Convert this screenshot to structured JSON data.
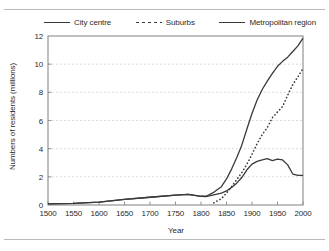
{
  "figure": {
    "has_top_rule": true,
    "has_bottom_rule": true,
    "background": "#ffffff",
    "line_color": "#3a3a3a",
    "grid_color": "#c8c8c8",
    "frame_color": "#8a8a8a"
  },
  "legend": {
    "position": "top",
    "items": [
      {
        "label": "City centre",
        "style": "solid",
        "icon": "solid-line-icon"
      },
      {
        "label": "Suburbs",
        "style": "dashed",
        "icon": "dashed-line-icon"
      },
      {
        "label": "Metropolitan region",
        "style": "solid",
        "icon": "solid-line-icon"
      }
    ]
  },
  "chart_data": {
    "type": "line",
    "title": "",
    "xlabel": "Year",
    "ylabel": "Numbers of residents (millions)",
    "xlim": [
      1500,
      2000
    ],
    "ylim": [
      0,
      12
    ],
    "xticks": [
      1500,
      1550,
      1600,
      1650,
      1700,
      1750,
      1800,
      1850,
      1900,
      1950,
      2000
    ],
    "yticks": [
      0,
      2,
      4,
      6,
      8,
      10,
      12
    ],
    "grid": "horizontal-dotted",
    "legend_position": "top",
    "series": [
      {
        "name": "City centre",
        "style": "solid",
        "x": [
          1500,
          1550,
          1600,
          1650,
          1700,
          1750,
          1775,
          1800,
          1810,
          1825,
          1840,
          1850,
          1860,
          1870,
          1880,
          1890,
          1900,
          1910,
          1920,
          1930,
          1940,
          1950,
          1960,
          1970,
          1980,
          1990,
          2000
        ],
        "values": [
          0.08,
          0.12,
          0.2,
          0.4,
          0.55,
          0.7,
          0.75,
          0.62,
          0.6,
          0.72,
          0.85,
          1.0,
          1.25,
          1.55,
          1.95,
          2.5,
          2.9,
          3.1,
          3.2,
          3.3,
          3.15,
          3.25,
          3.2,
          2.85,
          2.2,
          2.1,
          2.1
        ]
      },
      {
        "name": "Suburbs",
        "style": "dashed",
        "x": [
          1825,
          1840,
          1850,
          1860,
          1870,
          1880,
          1890,
          1900,
          1910,
          1920,
          1930,
          1940,
          1950,
          1960,
          1970,
          1980,
          1990,
          2000
        ],
        "values": [
          0.15,
          0.45,
          0.85,
          1.3,
          1.8,
          2.3,
          2.9,
          3.6,
          4.35,
          5.0,
          5.5,
          6.2,
          6.6,
          7.0,
          7.8,
          8.55,
          9.1,
          9.7
        ]
      },
      {
        "name": "Metropolitan region",
        "style": "solid",
        "x": [
          1500,
          1550,
          1600,
          1650,
          1700,
          1750,
          1775,
          1800,
          1810,
          1825,
          1840,
          1850,
          1860,
          1870,
          1880,
          1890,
          1900,
          1910,
          1920,
          1930,
          1940,
          1950,
          1960,
          1970,
          1980,
          1990,
          2000
        ],
        "values": [
          0.08,
          0.12,
          0.2,
          0.4,
          0.55,
          0.7,
          0.75,
          0.62,
          0.62,
          0.9,
          1.3,
          1.85,
          2.55,
          3.35,
          4.25,
          5.4,
          6.5,
          7.45,
          8.2,
          8.8,
          9.35,
          9.85,
          10.2,
          10.5,
          10.9,
          11.3,
          11.85
        ]
      }
    ]
  }
}
